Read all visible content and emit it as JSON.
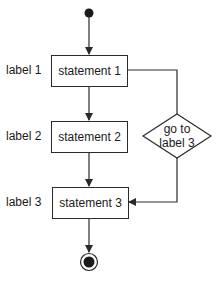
{
  "diagram": {
    "type": "flowchart",
    "nodes": {
      "start": {
        "kind": "initial-node"
      },
      "s1": {
        "label": "label 1",
        "text": "statement 1"
      },
      "s2": {
        "label": "label 2",
        "text": "statement 2"
      },
      "s3": {
        "label": "label 3",
        "text": "statement 3"
      },
      "goto": {
        "line1": "go to",
        "line2": "label 3"
      },
      "end": {
        "kind": "final-node"
      }
    },
    "edges": [
      {
        "from": "start",
        "to": "s1"
      },
      {
        "from": "s1",
        "to": "s2"
      },
      {
        "from": "s1",
        "to": "goto"
      },
      {
        "from": "s2",
        "to": "s3"
      },
      {
        "from": "goto",
        "to": "s3"
      },
      {
        "from": "s3",
        "to": "end"
      }
    ],
    "colors": {
      "stroke": "#2a2a2a",
      "fill": "#ffffff",
      "text": "#1a1a1a"
    }
  }
}
